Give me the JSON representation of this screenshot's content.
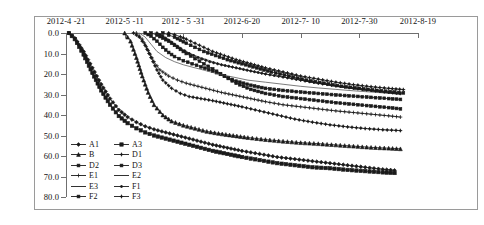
{
  "chart_data": {
    "type": "line",
    "title": "",
    "xlabel": "",
    "ylabel": "",
    "xtick_labels": [
      "2012-4 -21",
      "2012-5 -11",
      "2012 - 5 -31",
      "2012-6-20",
      "2012-7- 10",
      "2012-7-30",
      "2012-8-19"
    ],
    "xtick_values": [
      0,
      20,
      40,
      60,
      80,
      100,
      120
    ],
    "xlim": [
      0,
      120
    ],
    "ytick_labels": [
      "0.0",
      "10.0",
      "20.0",
      "30.0",
      "40.0",
      "50.0",
      "60.0",
      "70.0",
      "80.0"
    ],
    "ytick_values": [
      0,
      10,
      20,
      30,
      40,
      50,
      60,
      70,
      80
    ],
    "ylim": [
      80,
      0
    ],
    "y_inverted": true,
    "grid": false,
    "legend_position": "inside-lower-left",
    "legend_columns": 2,
    "series": [
      {
        "name": "A1",
        "marker": "diamond",
        "color": "#1a1a1a",
        "x": [
          1,
          3,
          6,
          9,
          12,
          15,
          18,
          21,
          24,
          27,
          30,
          34,
          38,
          42,
          46,
          50,
          55,
          60,
          66,
          72,
          78,
          84,
          90,
          96,
          102,
          108,
          112
        ],
        "y": [
          0.0,
          2.5,
          9.0,
          17.0,
          25.0,
          32.0,
          37.5,
          41.0,
          43.5,
          45.5,
          47.0,
          48.5,
          50.0,
          51.5,
          53.0,
          54.5,
          56.0,
          57.5,
          59.0,
          60.5,
          61.5,
          62.5,
          63.5,
          64.5,
          65.5,
          66.5,
          67.0
        ]
      },
      {
        "name": "A3",
        "marker": "square",
        "color": "#1a1a1a",
        "x": [
          1,
          3,
          6,
          9,
          12,
          15,
          18,
          21,
          24,
          27,
          30,
          34,
          38,
          42,
          46,
          50,
          55,
          60,
          66,
          72,
          78,
          84,
          90,
          96,
          102,
          108,
          112
        ],
        "y": [
          0.0,
          3.0,
          10.5,
          19.5,
          28.0,
          35.0,
          40.5,
          44.0,
          46.5,
          48.5,
          50.0,
          51.5,
          53.0,
          54.5,
          56.0,
          57.5,
          59.0,
          60.5,
          62.0,
          63.5,
          64.5,
          65.5,
          66.0,
          66.8,
          67.4,
          68.0,
          68.3
        ]
      },
      {
        "name": "B",
        "marker": "triangle",
        "color": "#1a1a1a",
        "x": [
          20,
          22,
          24,
          26,
          28,
          30,
          33,
          36,
          40,
          44,
          48,
          52,
          57,
          62,
          68,
          74,
          80,
          86,
          92,
          98,
          104,
          110,
          114
        ],
        "y": [
          0.0,
          4.0,
          12.0,
          21.0,
          29.0,
          35.0,
          40.0,
          43.0,
          45.0,
          46.5,
          48.0,
          49.0,
          50.0,
          51.0,
          52.0,
          52.8,
          53.5,
          54.0,
          54.6,
          55.2,
          55.8,
          56.2,
          56.5
        ]
      },
      {
        "name": "D1",
        "marker": "cross-dot",
        "color": "#1a1a1a",
        "x": [
          23,
          25,
          27,
          29,
          31,
          33,
          36,
          39,
          42,
          46,
          50,
          55,
          60,
          66,
          72,
          78,
          84,
          90,
          96,
          102,
          108,
          114
        ],
        "y": [
          0.0,
          2.0,
          6.0,
          12.0,
          18.0,
          23.0,
          27.0,
          29.5,
          31.0,
          32.0,
          33.0,
          34.5,
          36.0,
          38.0,
          40.0,
          42.0,
          43.5,
          44.8,
          45.8,
          46.6,
          47.2,
          47.6
        ]
      },
      {
        "name": "D2",
        "marker": "square-small",
        "color": "#1a1a1a",
        "x": [
          27,
          29,
          31,
          33,
          35,
          37,
          40,
          43,
          46,
          50,
          54,
          58,
          63,
          68,
          74,
          80,
          86,
          92,
          98,
          104,
          110,
          114
        ],
        "y": [
          0.0,
          1.5,
          4.0,
          7.0,
          9.5,
          11.5,
          13.5,
          15.0,
          16.5,
          18.5,
          21.0,
          23.5,
          25.5,
          27.0,
          28.0,
          28.8,
          29.5,
          30.2,
          30.8,
          31.4,
          32.0,
          32.4
        ]
      },
      {
        "name": "D3",
        "marker": "square-filled",
        "color": "#1a1a1a",
        "x": [
          29,
          31,
          33,
          35,
          37,
          39,
          41,
          44,
          47,
          50,
          54,
          58,
          63,
          68,
          74,
          80,
          86,
          92,
          98,
          104,
          110,
          114
        ],
        "y": [
          0.0,
          1.0,
          2.5,
          4.0,
          6.0,
          8.0,
          10.0,
          12.5,
          15.0,
          17.5,
          21.0,
          24.5,
          27.5,
          29.5,
          31.0,
          32.0,
          33.0,
          34.0,
          34.8,
          35.6,
          36.4,
          37.0
        ]
      },
      {
        "name": "E1",
        "marker": "plus",
        "color": "#1a1a1a",
        "x": [
          24,
          26,
          28,
          30,
          32,
          35,
          38,
          41,
          45,
          49,
          53,
          58,
          63,
          68,
          74,
          80,
          86,
          92,
          98,
          104,
          110,
          114
        ],
        "y": [
          0.0,
          3.0,
          8.5,
          14.0,
          18.0,
          21.0,
          23.0,
          24.5,
          26.0,
          27.5,
          29.0,
          30.5,
          32.0,
          33.5,
          35.0,
          36.0,
          37.0,
          38.0,
          38.8,
          39.6,
          40.4,
          41.0
        ]
      },
      {
        "name": "E2",
        "marker": "line",
        "color": "#444444",
        "x": [
          25,
          27,
          29,
          31,
          34,
          37,
          40,
          44,
          48,
          52,
          57,
          62,
          68,
          74,
          80,
          86,
          92,
          98,
          104,
          110,
          114
        ],
        "y": [
          0.0,
          2.0,
          5.5,
          9.0,
          12.0,
          14.0,
          15.5,
          17.0,
          18.5,
          20.0,
          21.5,
          23.0,
          24.0,
          25.0,
          26.0,
          26.8,
          27.5,
          28.2,
          28.8,
          29.4,
          29.8
        ]
      },
      {
        "name": "E3",
        "marker": "line",
        "color": "#444444",
        "x": [
          30,
          32,
          34,
          36,
          38,
          41,
          44,
          48,
          52,
          56,
          61,
          66,
          72,
          78,
          84,
          90,
          96,
          102,
          108,
          114
        ],
        "y": [
          0.0,
          1.0,
          2.5,
          4.5,
          6.5,
          9.0,
          11.0,
          13.0,
          15.0,
          16.5,
          18.0,
          19.5,
          21.0,
          22.5,
          24.0,
          25.5,
          26.8,
          28.0,
          29.0,
          30.0
        ]
      },
      {
        "name": "F1",
        "marker": "diamond-small",
        "color": "#1a1a1a",
        "x": [
          31,
          33,
          35,
          37,
          39,
          42,
          45,
          49,
          53,
          58,
          63,
          68,
          74,
          80,
          86,
          92,
          98,
          104,
          110,
          114
        ],
        "y": [
          0.0,
          1.5,
          3.5,
          5.5,
          7.5,
          10.0,
          12.0,
          14.0,
          15.5,
          17.0,
          18.5,
          20.0,
          21.5,
          23.0,
          24.5,
          25.8,
          27.0,
          28.0,
          29.0,
          29.6
        ]
      },
      {
        "name": "F2",
        "marker": "square-dot",
        "color": "#1a1a1a",
        "x": [
          33,
          35,
          37,
          39,
          41,
          44,
          47,
          51,
          55,
          60,
          65,
          70,
          76,
          82,
          88,
          94,
          100,
          106,
          112,
          115
        ],
        "y": [
          0.0,
          1.0,
          2.0,
          3.5,
          5.0,
          7.0,
          9.0,
          11.0,
          13.0,
          15.0,
          17.0,
          19.0,
          21.0,
          23.0,
          24.5,
          26.0,
          27.0,
          28.0,
          28.8,
          29.2
        ]
      },
      {
        "name": "F3",
        "marker": "cross",
        "color": "#1a1a1a",
        "x": [
          35,
          37,
          39,
          41,
          44,
          47,
          50,
          54,
          58,
          63,
          68,
          74,
          80,
          86,
          92,
          98,
          104,
          110,
          115
        ],
        "y": [
          0.0,
          0.8,
          1.8,
          3.0,
          5.0,
          7.0,
          9.0,
          11.0,
          13.0,
          15.0,
          17.0,
          19.0,
          21.0,
          22.5,
          24.0,
          25.2,
          26.2,
          27.0,
          27.6
        ]
      }
    ]
  },
  "legend": {
    "entries": [
      {
        "label": "A1",
        "marker": "diamond"
      },
      {
        "label": "A3",
        "marker": "square"
      },
      {
        "label": "B",
        "marker": "triangle"
      },
      {
        "label": "D1",
        "marker": "cross-dot"
      },
      {
        "label": "D2",
        "marker": "square-small"
      },
      {
        "label": "D3",
        "marker": "square-filled"
      },
      {
        "label": "E1",
        "marker": "plus"
      },
      {
        "label": "E2",
        "marker": "line"
      },
      {
        "label": "E3",
        "marker": "line"
      },
      {
        "label": "F1",
        "marker": "diamond-small"
      },
      {
        "label": "F2",
        "marker": "square-dot"
      },
      {
        "label": "F3",
        "marker": "cross"
      }
    ]
  }
}
